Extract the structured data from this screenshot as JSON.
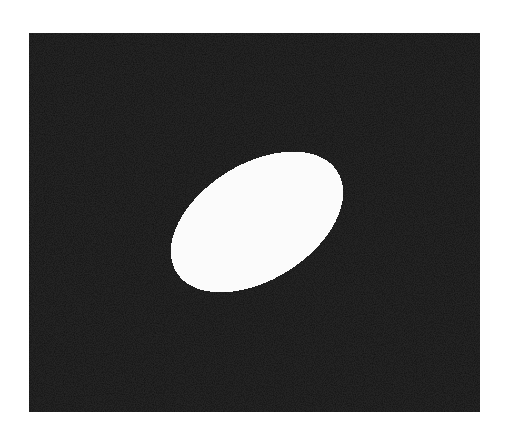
{
  "figure": {
    "background_color": "#ffffff",
    "panel": {
      "x": 29,
      "y": 33,
      "width": 451,
      "height": 379,
      "color": "#141414"
    },
    "ellipse": {
      "cx": 257,
      "cy": 222,
      "rx": 95,
      "ry": 58,
      "rotation_deg": -32,
      "color": "#fbfbfb"
    }
  }
}
